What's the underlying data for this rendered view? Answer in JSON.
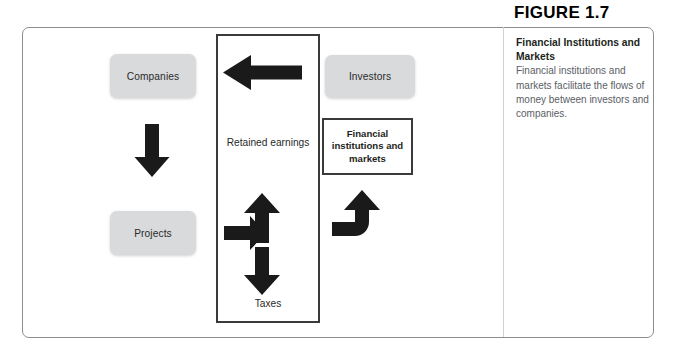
{
  "figure": {
    "number_label": "FIGURE 1.7",
    "caption_title": "Financial Institutions and Markets",
    "caption_body": "Financial institutions and markets facilitate the flows of money between investors and companies."
  },
  "diagram": {
    "type": "flow-diagram",
    "nodes": [
      {
        "id": "companies",
        "label": "Companies",
        "shape": "rounded-rect",
        "fill": "#d9dadb",
        "x": 110,
        "y": 54,
        "w": 86,
        "h": 44
      },
      {
        "id": "projects",
        "label": "Projects",
        "shape": "rounded-rect",
        "fill": "#d9dadb",
        "x": 110,
        "y": 211,
        "w": 86,
        "h": 44
      },
      {
        "id": "investors",
        "label": "Investors",
        "shape": "rounded-rect",
        "fill": "#d9dadb",
        "x": 325,
        "y": 55,
        "w": 90,
        "h": 43
      },
      {
        "id": "firm",
        "label": "",
        "shape": "outline-rect",
        "fill": "none",
        "x": 216,
        "y": 34,
        "w": 104,
        "h": 289
      },
      {
        "id": "fim",
        "label": "Financial institutions and markets",
        "shape": "outline-rect",
        "fill": "#ffffff",
        "x": 322,
        "y": 118,
        "w": 91,
        "h": 57
      }
    ],
    "labels": [
      {
        "id": "retained-earnings",
        "text": "Retained earnings",
        "x": 224,
        "y": 136
      },
      {
        "id": "taxes",
        "text": "Taxes",
        "x": 224,
        "y": 297
      }
    ],
    "arrows": [
      {
        "id": "cash-to-companies",
        "direction": "left",
        "from": "firm",
        "to": "companies"
      },
      {
        "id": "companies-to-projects",
        "direction": "down",
        "from": "companies",
        "to": "projects"
      },
      {
        "id": "projects-to-firm",
        "direction": "right",
        "from": "projects",
        "to": "firm"
      },
      {
        "id": "retained-earnings-up",
        "direction": "up",
        "from": "firm",
        "to": "retained-earnings"
      },
      {
        "id": "taxes-down",
        "direction": "down",
        "from": "firm",
        "to": "taxes"
      },
      {
        "id": "markets-to-investors",
        "direction": "curve-up-right",
        "from": "fim",
        "to": "investors"
      }
    ],
    "colors": {
      "arrow": "#1a1a1a",
      "node_fill": "#d9dadb",
      "box_border": "#3a3a3a",
      "frame_border": "#8b8d8f",
      "caption_body": "#5b6065"
    }
  }
}
